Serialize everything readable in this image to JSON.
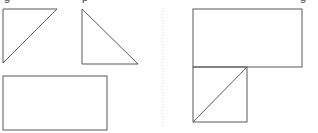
{
  "figure": {
    "canvas": {
      "width": 318,
      "height": 133,
      "background": "#ffffff"
    },
    "stroke_color": "#595959",
    "stroke_width": 1,
    "fill_color": "none",
    "divider": {
      "name": "vertical-dotted-divider",
      "color": "#d8d8d8",
      "x": 163,
      "y_start": 8,
      "y_end": 128,
      "style": "dotted"
    },
    "clipped_text_above": {
      "note": "descenders of a cut-off text line at the very top edge",
      "fragments": [
        {
          "glyph": "g",
          "x": 4
        },
        {
          "glyph": "p",
          "x": 82
        },
        {
          "glyph": "g",
          "x": 300
        }
      ]
    },
    "left_panel": {
      "label": "left-shape-group",
      "shapes": [
        {
          "name": "right-triangle-upper-left",
          "type": "triangle",
          "orientation": "right angle at top-left, hypotenuse from bottom-left to top-right",
          "points": "3,9 57,9 3,63",
          "vertices": [
            [
              3,
              9
            ],
            [
              57,
              9
            ],
            [
              3,
              63
            ]
          ],
          "width": 54,
          "height": 54
        },
        {
          "name": "right-triangle-upper-middle",
          "type": "triangle",
          "orientation": "right angle at bottom-left, hypotenuse from top-left to bottom-right",
          "points": "82,9 82,64 138,64",
          "vertices": [
            [
              82,
              9
            ],
            [
              82,
              64
            ],
            [
              138,
              64
            ]
          ],
          "width": 56,
          "height": 55
        },
        {
          "name": "rectangle-lower-left",
          "type": "rectangle",
          "x": 3,
          "y": 76,
          "width": 104,
          "height": 54
        }
      ]
    },
    "right_panel": {
      "label": "right-shape-group",
      "description": "L-shaped composite figure: wide rectangle on top, square below-left divided by a diagonal",
      "shapes": [
        {
          "name": "rectangle-top-right-panel",
          "type": "rectangle",
          "x": 193,
          "y": 9,
          "width": 109,
          "height": 58
        },
        {
          "name": "square-bottom-right-panel",
          "type": "rectangle",
          "x": 193,
          "y": 67,
          "width": 54,
          "height": 55
        },
        {
          "name": "diagonal-in-square",
          "type": "line",
          "from": [
            193,
            122
          ],
          "to": [
            247,
            67
          ],
          "orientation": "bottom-left to top-right"
        }
      ]
    }
  }
}
